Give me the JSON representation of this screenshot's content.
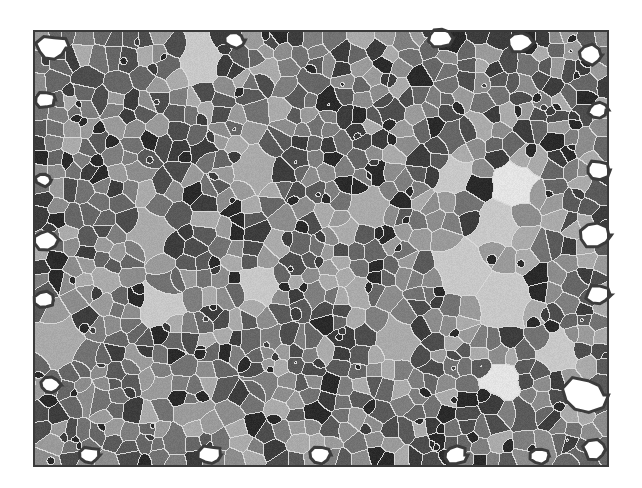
{
  "figure": {
    "canvas": {
      "width": 642,
      "height": 488
    },
    "frame": {
      "x": 33,
      "y": 30,
      "width": 576,
      "height": 437,
      "color": "#3a3a3a"
    },
    "colors": {
      "background": "#ffffff",
      "boundary": "#d8d8d8",
      "void_outline": "#3c3c3c",
      "gray_levels": [
        "#2a2a2a",
        "#3d3d3d",
        "#4d4d4d",
        "#5a5a5a",
        "#666666",
        "#727272",
        "#7e7e7e",
        "#8c8c8c",
        "#9a9a9a",
        "#aaaaaa"
      ],
      "bright_grain": "#c8c8c8",
      "brightest_grain": "#e4e4e4"
    },
    "grains": {
      "seed": 20240611,
      "count": 900,
      "bright_grains": [
        {
          "x": 515,
          "y": 183,
          "r": 22,
          "level": "brightest"
        },
        {
          "x": 497,
          "y": 225,
          "r": 24,
          "level": "bright"
        },
        {
          "x": 503,
          "y": 380,
          "r": 20,
          "level": "brightest"
        },
        {
          "x": 260,
          "y": 285,
          "r": 18,
          "level": "bright"
        },
        {
          "x": 160,
          "y": 305,
          "r": 20,
          "level": "bright"
        },
        {
          "x": 60,
          "y": 345,
          "r": 26,
          "level": "mid"
        },
        {
          "x": 200,
          "y": 60,
          "r": 24,
          "level": "bright"
        },
        {
          "x": 560,
          "y": 350,
          "r": 18,
          "level": "bright"
        },
        {
          "x": 460,
          "y": 270,
          "r": 26,
          "level": "bright"
        },
        {
          "x": 505,
          "y": 300,
          "r": 30,
          "level": "bright"
        },
        {
          "x": 370,
          "y": 205,
          "r": 20,
          "level": "mid"
        },
        {
          "x": 255,
          "y": 170,
          "r": 22,
          "level": "mid"
        },
        {
          "x": 395,
          "y": 340,
          "r": 22,
          "level": "mid"
        },
        {
          "x": 150,
          "y": 235,
          "r": 20,
          "level": "mid"
        },
        {
          "x": 455,
          "y": 175,
          "r": 16,
          "level": "bright"
        }
      ],
      "voids": [
        {
          "x": 52,
          "y": 48,
          "r": 16
        },
        {
          "x": 235,
          "y": 40,
          "r": 10
        },
        {
          "x": 440,
          "y": 38,
          "r": 12
        },
        {
          "x": 520,
          "y": 42,
          "r": 14
        },
        {
          "x": 590,
          "y": 55,
          "r": 12
        },
        {
          "x": 598,
          "y": 110,
          "r": 10
        },
        {
          "x": 598,
          "y": 170,
          "r": 12
        },
        {
          "x": 595,
          "y": 235,
          "r": 16
        },
        {
          "x": 598,
          "y": 295,
          "r": 12
        },
        {
          "x": 585,
          "y": 395,
          "r": 22
        },
        {
          "x": 595,
          "y": 450,
          "r": 12
        },
        {
          "x": 45,
          "y": 100,
          "r": 10
        },
        {
          "x": 44,
          "y": 180,
          "r": 8
        },
        {
          "x": 46,
          "y": 240,
          "r": 12
        },
        {
          "x": 45,
          "y": 300,
          "r": 10
        },
        {
          "x": 50,
          "y": 385,
          "r": 10
        },
        {
          "x": 90,
          "y": 455,
          "r": 10
        },
        {
          "x": 210,
          "y": 455,
          "r": 12
        },
        {
          "x": 320,
          "y": 455,
          "r": 10
        },
        {
          "x": 455,
          "y": 455,
          "r": 12
        },
        {
          "x": 540,
          "y": 456,
          "r": 10
        }
      ]
    }
  }
}
